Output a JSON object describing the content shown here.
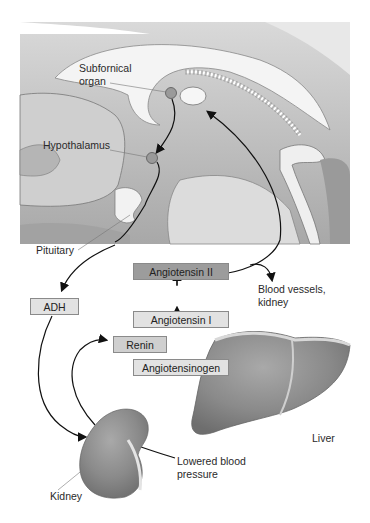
{
  "diagram": {
    "type": "physiology-pathway",
    "brain_labels": {
      "subfornical_organ": "Subfornical\norgan",
      "subfornical_line1": "Subfornical",
      "subfornical_line2": "organ",
      "hypothalamus": "Hypothalamus",
      "pituitary": "Pituitary"
    },
    "boxes": {
      "angiotensin_ii": "Angiotensin II",
      "angiotensin_i": "Angiotensin I",
      "angiotensinogen": "Angiotensinogen",
      "renin": "Renin",
      "adh": "ADH"
    },
    "targets": {
      "blood_vessels_line1": "Blood vessels,",
      "blood_vessels_line2": "kidney"
    },
    "organs": {
      "liver": "Liver",
      "kidney": "Kidney"
    },
    "stimulus": {
      "line1": "Lowered blood",
      "line2": "pressure"
    },
    "colors": {
      "box_light": "#e2e2e2",
      "box_dark": "#9c9c9c",
      "organ_gray": "#8c8c8c",
      "brain_gray": "#c9c9c9",
      "arrow": "#111111"
    }
  }
}
